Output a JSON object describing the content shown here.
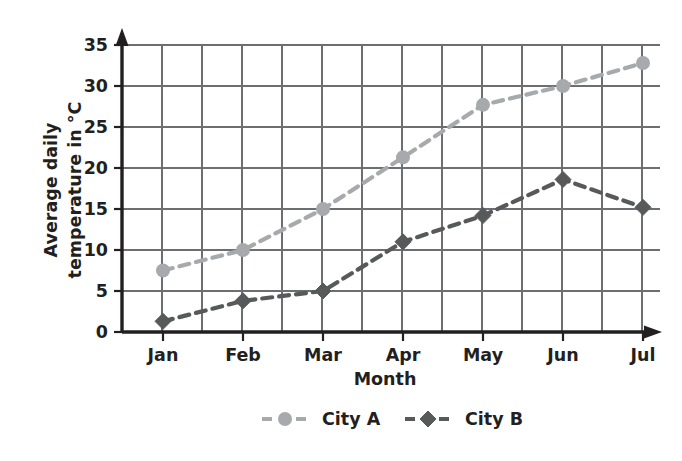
{
  "chart_data": {
    "type": "line",
    "title": "",
    "xlabel": "Month",
    "ylabel": "Average daily temperature in °C",
    "ylabel_lines": [
      "Average daily",
      "temperature in °C"
    ],
    "categories": [
      "Jan",
      "Feb",
      "Mar",
      "Apr",
      "May",
      "Jun",
      "Jul"
    ],
    "x_tick_labels": [
      "Jan",
      "Feb",
      "Mar",
      "Apr",
      "May",
      "Jun",
      "Jul"
    ],
    "y_tick_labels": [
      "0",
      "5",
      "10",
      "15",
      "20",
      "25",
      "30",
      "35"
    ],
    "y_ticks": [
      0,
      5,
      10,
      15,
      20,
      25,
      30,
      35
    ],
    "ylim": [
      0,
      35
    ],
    "grid": true,
    "legend_position": "bottom",
    "series": [
      {
        "name": "City A",
        "values": [
          7.5,
          10.0,
          15.0,
          21.3,
          27.7,
          30.0,
          32.8
        ],
        "color": "#a7a9ac",
        "marker": "circle",
        "linestyle": "dashed"
      },
      {
        "name": "City B",
        "values": [
          1.3,
          3.8,
          5.0,
          11.0,
          14.2,
          18.6,
          15.2
        ],
        "color": "#58595b",
        "marker": "diamond",
        "linestyle": "dashed"
      }
    ]
  },
  "legend": {
    "entries": [
      {
        "label": "City A",
        "color": "#a7a9ac",
        "marker": "circle"
      },
      {
        "label": "City B",
        "color": "#58595b",
        "marker": "diamond"
      }
    ]
  },
  "colors": {
    "axis": "#231f20",
    "grid": "#6d6e71",
    "series_a": "#a7a9ac",
    "series_b": "#58595b",
    "background": "#ffffff"
  }
}
